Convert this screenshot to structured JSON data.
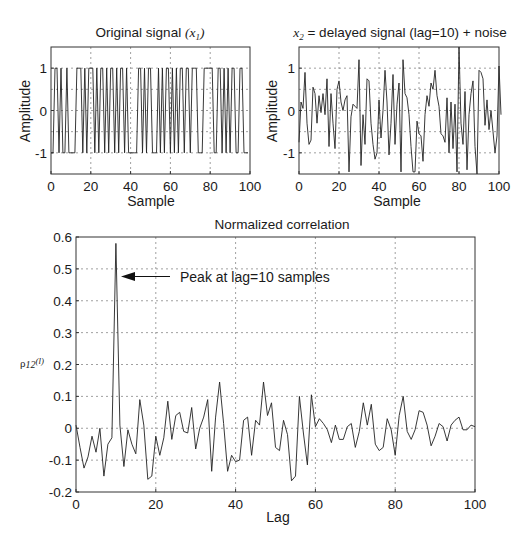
{
  "chart_data": [
    {
      "id": "original",
      "type": "line",
      "title": "Original signal (x1)",
      "title_main": "Original signal ",
      "title_math": "(x",
      "title_sub": "1",
      "title_close": ")",
      "xlabel": "Sample",
      "ylabel": "Amplitude",
      "xlim": [
        0,
        100
      ],
      "ylim": [
        -1.5,
        1.5
      ],
      "xticks": [
        0,
        20,
        40,
        60,
        80,
        100
      ],
      "yticks": [
        -1,
        0,
        1
      ],
      "grid": true,
      "x": [
        0,
        1,
        2,
        3,
        4,
        5,
        6,
        7,
        8,
        9,
        10,
        11,
        12,
        13,
        14,
        15,
        16,
        17,
        18,
        19,
        20,
        21,
        22,
        23,
        24,
        25,
        26,
        27,
        28,
        29,
        30,
        31,
        32,
        33,
        34,
        35,
        36,
        37,
        38,
        39,
        40,
        41,
        42,
        43,
        44,
        45,
        46,
        47,
        48,
        49,
        50,
        51,
        52,
        53,
        54,
        55,
        56,
        57,
        58,
        59,
        60,
        61,
        62,
        63,
        64,
        65,
        66,
        67,
        68,
        69,
        70,
        71,
        72,
        73,
        74,
        75,
        76,
        77,
        78,
        79,
        80,
        81,
        82,
        83,
        84,
        85,
        86,
        87,
        88,
        89,
        90,
        91,
        92,
        93,
        94,
        95,
        96,
        97,
        98,
        99
      ],
      "values": [
        -1,
        -1,
        1,
        1,
        -1,
        1,
        -1,
        -1,
        1,
        -1,
        -1,
        -1,
        -1,
        1,
        1,
        1,
        -1,
        1,
        -1,
        1,
        1,
        1,
        -1,
        1,
        -1,
        1,
        1,
        -1,
        1,
        -1,
        1,
        1,
        -1,
        1,
        -1,
        1,
        1,
        -1,
        1,
        -1,
        -1,
        -1,
        -1,
        -1,
        1,
        1,
        -1,
        1,
        -1,
        1,
        1,
        -1,
        -1,
        -1,
        1,
        -1,
        1,
        -1,
        1,
        1,
        -1,
        1,
        -1,
        1,
        -1,
        1,
        1,
        -1,
        1,
        1,
        -1,
        1,
        1,
        1,
        -1,
        -1,
        -1,
        1,
        1,
        1,
        1,
        1,
        -1,
        -1,
        1,
        1,
        -1,
        1,
        -1,
        1,
        -1,
        1,
        1,
        -1,
        -1,
        1,
        1,
        -1,
        -1,
        -1
      ]
    },
    {
      "id": "delayed",
      "type": "line",
      "title": "x2 = delayed signal (lag=10) + noise",
      "title_math": "x",
      "title_sub": "2",
      "title_main": " = delayed signal (lag=10) + noise",
      "xlabel": "Sample",
      "ylabel": "Amplitude",
      "xlim": [
        0,
        100
      ],
      "ylim": [
        -1.5,
        1.5
      ],
      "xticks": [
        0,
        20,
        40,
        60,
        80,
        100
      ],
      "yticks": [
        -1,
        0,
        1
      ],
      "grid": true,
      "values": [
        -0.75,
        0.2,
        0.05,
        0.9,
        -0.3,
        -0.8,
        -0.7,
        0.55,
        0.4,
        -0.3,
        0.35,
        -0.05,
        0.4,
        -0.1,
        0.75,
        -0.85,
        0.4,
        -0.3,
        -0.9,
        0.5,
        0.7,
        0.2,
        0.0,
        0.25,
        0.35,
        -1.45,
        -0.15,
        0.15,
        0.1,
        0.05,
        1.2,
        -1.3,
        -0.1,
        -0.8,
        0.75,
        0.7,
        -0.3,
        -0.8,
        -1.15,
        -1.0,
        0.25,
        -0.65,
        0.0,
        0.95,
        0.2,
        -1.05,
        -0.3,
        0.85,
        -0.8,
        0.15,
        0.65,
        -1.45,
        1.2,
        0.4,
        0.3,
        -0.1,
        -0.85,
        -1.45,
        -1.45,
        -0.25,
        -0.55,
        -0.6,
        -1.2,
        -0.1,
        0.35,
        0.1,
        0.65,
        0.5,
        0.95,
        0.35,
        0.1,
        -0.55,
        -0.6,
        -0.75,
        0.3,
        -1.0,
        0.2,
        -0.9,
        0.15,
        -1.45,
        1.5,
        -0.3,
        -0.8,
        0.45,
        -1.4,
        -0.1,
        0.4,
        0.7,
        -0.85,
        -1.5,
        0.95,
        0.9,
        0.75,
        -0.35,
        0.25,
        -0.45,
        0.0,
        -0.5,
        -1.0,
        -0.6,
        1.05,
        -0.1
      ]
    },
    {
      "id": "correlation",
      "type": "line",
      "title": "Normalized correlation",
      "xlabel": "Lag",
      "ylabel": "ρ12(l)",
      "ylabel_rho": "ρ",
      "ylabel_sub": "12",
      "ylabel_arg": "(l)",
      "xlim": [
        0,
        100
      ],
      "ylim": [
        -0.2,
        0.6
      ],
      "xticks": [
        0,
        20,
        40,
        60,
        80,
        100
      ],
      "yticks": [
        -0.2,
        -0.1,
        0,
        0.1,
        0.2,
        0.3,
        0.4,
        0.5,
        0.6
      ],
      "grid": true,
      "annotations": [
        {
          "text": "Peak at lag=10 samples",
          "arrow_to": {
            "x": 10.3,
            "y": 0.475
          },
          "text_at": {
            "x": 18.5,
            "y": 0.475
          }
        }
      ],
      "peak": {
        "lag": 10,
        "value": 0.58
      },
      "x": [
        0,
        1,
        2,
        3,
        4,
        5,
        6,
        7,
        8,
        9,
        10,
        11,
        12,
        13,
        14,
        15,
        16,
        17,
        18,
        19,
        20,
        21,
        22,
        23,
        24,
        25,
        26,
        27,
        28,
        29,
        30,
        31,
        32,
        33,
        34,
        35,
        36,
        37,
        38,
        39,
        40,
        41,
        42,
        43,
        44,
        45,
        46,
        47,
        48,
        49,
        50,
        51,
        52,
        53,
        54,
        55,
        56,
        57,
        58,
        59,
        60,
        61,
        62,
        63,
        64,
        65,
        66,
        67,
        68,
        69,
        70,
        71,
        72,
        73,
        74,
        75,
        76,
        77,
        78,
        79,
        80,
        81,
        82,
        83,
        84,
        85,
        86,
        87,
        88,
        89,
        90,
        91,
        92,
        93,
        94,
        95,
        96,
        97,
        98,
        99,
        100
      ],
      "values": [
        0.01,
        -0.06,
        -0.125,
        -0.09,
        -0.025,
        -0.075,
        0.0,
        -0.15,
        -0.05,
        -0.03,
        0.58,
        0.01,
        -0.12,
        -0.005,
        -0.05,
        -0.08,
        0.09,
        0.01,
        -0.16,
        -0.15,
        -0.025,
        -0.085,
        -0.03,
        0.085,
        -0.035,
        0.04,
        0.05,
        -0.01,
        -0.015,
        0.065,
        -0.065,
        0.0,
        0.035,
        0.09,
        -0.135,
        0.035,
        0.145,
        0.015,
        -0.135,
        -0.085,
        -0.105,
        -0.1,
        0.025,
        0.035,
        -0.085,
        0.025,
        0.01,
        0.145,
        0.04,
        0.08,
        -0.06,
        -0.07,
        0.025,
        -0.02,
        -0.165,
        -0.15,
        0.1,
        -0.015,
        -0.115,
        0.105,
        0.005,
        0.03,
        0.015,
        -0.005,
        -0.045,
        0.01,
        -0.035,
        -0.035,
        0.005,
        0.015,
        -0.06,
        -0.01,
        0.08,
        0.01,
        0.075,
        -0.05,
        -0.07,
        -0.06,
        0.03,
        -0.005,
        -0.085,
        0.04,
        0.1,
        -0.01,
        -0.035,
        -0.005,
        0.055,
        0.05,
        0.01,
        -0.055,
        -0.025,
        0.015,
        0.005,
        -0.04,
        0.01,
        0.025,
        0.035,
        -0.005,
        -0.005,
        0.01,
        0.005
      ]
    }
  ]
}
